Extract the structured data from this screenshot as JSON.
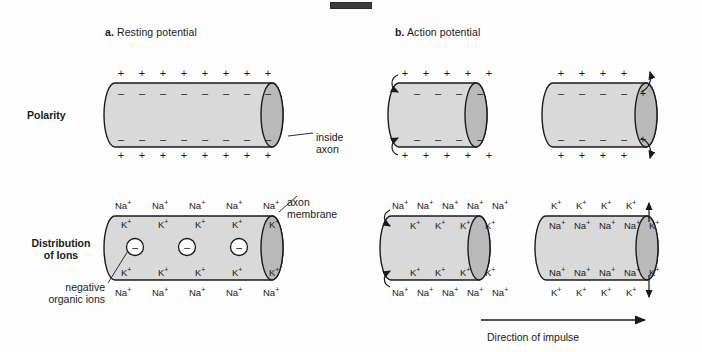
{
  "figure": {
    "panels": [
      {
        "id": "a",
        "marker": "a.",
        "title": "Resting potential"
      },
      {
        "id": "b",
        "marker": "b.",
        "title": "Action potential"
      }
    ],
    "row_labels": {
      "polarity": "Polarity",
      "distribution_line1": "Distribution",
      "distribution_line2": "of Ions"
    },
    "callouts": {
      "inside_axon_line1": "inside",
      "inside_axon_line2": "axon",
      "axon_membrane_line1": "axon",
      "axon_membrane_line2": "membrane",
      "negative_ions_line1": "negative",
      "negative_ions_line2": "organic ions"
    },
    "impulse_label": "Direction of impulse",
    "signs": {
      "plus": "+",
      "minus": "–",
      "negative_ion": "–"
    },
    "ions": {
      "sodium": "Na",
      "potassium": "K",
      "charge": "+"
    },
    "colors": {
      "membrane_fill": "#d9d9d9",
      "endcap_fill": "#b9b9b9",
      "stroke": "#1a1a1a",
      "text": "#1a1a1a",
      "background": "#fdfdfd"
    },
    "counts": {
      "resting_polarity_signs": 8,
      "action_left_polarity_signs": 5,
      "action_right_polarity_signs": 4,
      "resting_ion_columns": 5,
      "action_left_na_count": 5,
      "action_left_k_count": 4,
      "action_right_k_outside": 4,
      "action_right_na_inside": 4,
      "negative_organic_ions": 3
    }
  }
}
